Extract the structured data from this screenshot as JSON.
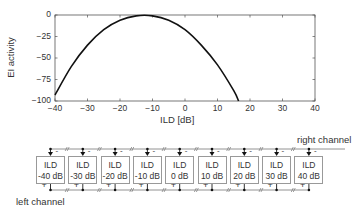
{
  "chart_data": {
    "type": "line",
    "title": "",
    "xlabel": "ILD [dB]",
    "ylabel": "EI activity",
    "xlim": [
      -40,
      40
    ],
    "ylim": [
      -100,
      0
    ],
    "xticks": [
      "-40",
      "-30",
      "-20",
      "-10",
      "0",
      "10",
      "20",
      "30",
      "40"
    ],
    "yticks": [
      "0",
      "-25",
      "-50",
      "-75",
      "-100"
    ],
    "grid": false,
    "series": [
      {
        "name": "EI activity",
        "x": [
          -40,
          -35,
          -30,
          -25,
          -20,
          -15,
          -10,
          -5,
          0,
          5,
          10,
          15,
          16.5
        ],
        "y": [
          -93,
          -60,
          -35,
          -17,
          -6,
          -1,
          -1,
          -6,
          -17,
          -35,
          -58,
          -88,
          -100
        ]
      }
    ]
  },
  "diagram": {
    "right_channel_label": "right channel",
    "left_channel_label": "left channel",
    "units": [
      {
        "title": "ILD",
        "value": "-40 dB"
      },
      {
        "title": "ILD",
        "value": "-30 dB"
      },
      {
        "title": "ILD",
        "value": "-20 dB"
      },
      {
        "title": "ILD",
        "value": "-10 dB"
      },
      {
        "title": "ILD",
        "value": "0 dB"
      },
      {
        "title": "ILD",
        "value": "10 dB"
      },
      {
        "title": "ILD",
        "value": "20 dB"
      },
      {
        "title": "ILD",
        "value": "30 dB"
      },
      {
        "title": "ILD",
        "value": "40 dB"
      }
    ],
    "plus_sign": "+",
    "minus_sign": "-"
  }
}
